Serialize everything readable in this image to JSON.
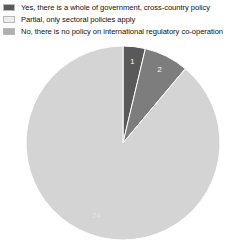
{
  "legend": {
    "position": "top-left",
    "items": [
      {
        "label": "Yes, there is a whole of government, cross-country policy",
        "color": "#595959",
        "key": "yes"
      },
      {
        "label": "Partial, only sectoral policies apply",
        "color": "#e8e8e8",
        "key": "partial"
      },
      {
        "label": "No, there is no policy on international regulatory co-operation",
        "color": "#a8a8a8",
        "key": "no"
      }
    ]
  },
  "chart_data": {
    "type": "pie",
    "title": "",
    "total": 27,
    "categories": [
      "Yes, there is a whole of government, cross-country policy",
      "No, there is no policy on international regulatory co-operation",
      "Partial, only sectoral policies apply"
    ],
    "values": [
      1,
      2,
      24
    ],
    "labels": [
      "1",
      "2",
      "24"
    ],
    "colors": [
      "#595959",
      "#7d7d7d",
      "#d4d4d4"
    ],
    "start_angle_deg": 0,
    "direction": "clockwise",
    "legend": "top-left",
    "grid": false
  }
}
